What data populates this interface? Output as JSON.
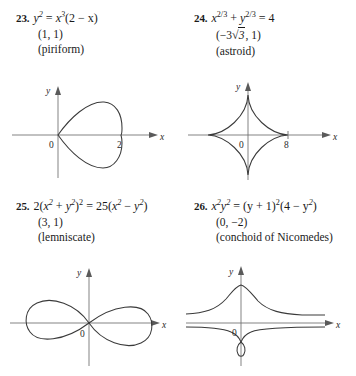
{
  "document": {
    "type": "textbook-exercise-set",
    "problems": [
      {
        "number": "23.",
        "equation_plain": "y² = x³(2 − x)",
        "equation": {
          "lhs_var": "y",
          "lhs_exp": "2",
          "rhs_var": "x",
          "rhs_exp": "3",
          "rhs_paren": "(2 − x)",
          "eq": "="
        },
        "point": "(1, 1)",
        "curve_name": "(piriform)",
        "graph": {
          "y_label": "y",
          "x_label": "x",
          "origin_label": "0",
          "x_tick_label": "2",
          "curve_type": "piriform"
        }
      },
      {
        "number": "24.",
        "equation_plain": "x^(2/3) + y^(2/3) = 4",
        "equation": {
          "term1_var": "x",
          "term1_exp": "2/3",
          "plus": "+",
          "term2_var": "y",
          "term2_exp": "2/3",
          "eq": "=",
          "rhs": "4"
        },
        "point": "(−3√3, 1)",
        "point_parts": {
          "open": "(−3",
          "radical_sign": "√",
          "radicand": "3",
          "close": ", 1)"
        },
        "curve_name": "(astroid)",
        "graph": {
          "y_label": "y",
          "x_label": "x",
          "origin_label": "0",
          "x_tick_label": "8",
          "curve_type": "astroid"
        }
      },
      {
        "number": "25.",
        "equation_plain": "2(x² + y²)² = 25(x² − y²)",
        "equation": {
          "lead": "2(",
          "v1": "x",
          "e1": "2",
          "plus": "+",
          "v2": "y",
          "e2": "2",
          "close_exp": ")",
          "outer_exp": "2",
          "eq": "=",
          "rhs_lead": "25(",
          "v3": "x",
          "e3": "2",
          "minus": "−",
          "v4": "y",
          "e4": "2",
          "rhs_close": ")"
        },
        "point": "(3, 1)",
        "curve_name": "(lemniscate)",
        "graph": {
          "y_label": "y",
          "x_label": "x",
          "origin_label": "0",
          "x_tick_label": "",
          "curve_type": "lemniscate"
        }
      },
      {
        "number": "26.",
        "equation_plain": "x²y² = (y + 1)²(4 − y²)",
        "equation": {
          "v1": "x",
          "e1": "2",
          "v2": "y",
          "e2": "2",
          "eq": "=",
          "p1": "(y + 1)",
          "pe1": "2",
          "p2": "(4 − y",
          "pe2": "2",
          "p3": ")"
        },
        "point": "(0, −2)",
        "curve_name": "(conchoid of Nicomedes)",
        "graph": {
          "y_label": "y",
          "x_label": "x",
          "origin_label": "0",
          "x_tick_label": "",
          "curve_type": "conchoid"
        }
      }
    ]
  },
  "colors": {
    "ink": "#1a1a1a",
    "curve": "#3a3a3a",
    "axis": "#6e6e6e",
    "background": "#ffffff"
  }
}
